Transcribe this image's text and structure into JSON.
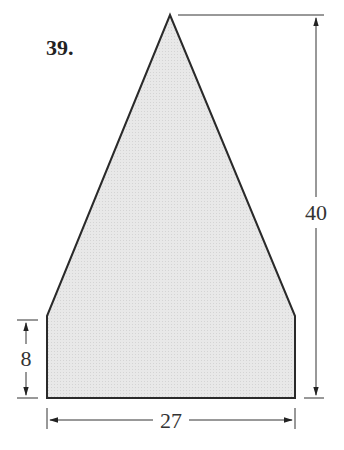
{
  "problem": {
    "number": "39."
  },
  "figure": {
    "shape": "pentagon (triangle atop rectangle)",
    "fill_color": "#e6e6e6",
    "stroke_color": "#2a2a2a",
    "dimensions": {
      "total_height": "40",
      "rectangle_height": "8",
      "base_width": "27"
    }
  }
}
